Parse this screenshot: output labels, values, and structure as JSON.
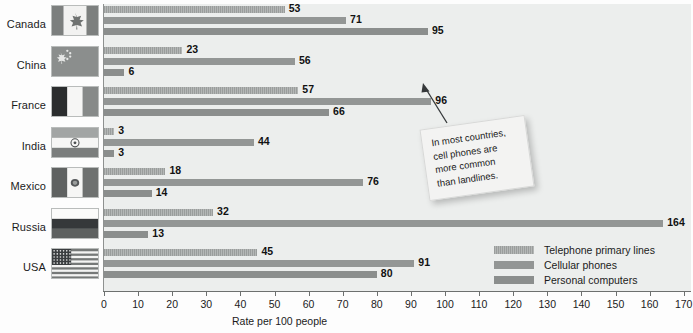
{
  "chart_data": {
    "type": "bar",
    "orientation": "horizontal",
    "title": "",
    "xlabel": "Rate per 100 people",
    "ylabel": "",
    "xlim": [
      0,
      175
    ],
    "xticks": [
      0,
      10,
      20,
      30,
      40,
      50,
      60,
      70,
      80,
      90,
      100,
      110,
      120,
      130,
      140,
      150,
      160,
      170
    ],
    "grid": false,
    "legend_position": "inside-bottom-right",
    "categories": [
      "Canada",
      "China",
      "France",
      "India",
      "Mexico",
      "Russia",
      "USA"
    ],
    "series": [
      {
        "name": "Telephone primary lines",
        "color": "#a7aaa9",
        "values": [
          53,
          23,
          57,
          3,
          18,
          32,
          45
        ]
      },
      {
        "name": "Cellular phones",
        "color": "#939695",
        "values": [
          71,
          56,
          96,
          44,
          76,
          164,
          91
        ]
      },
      {
        "name": "Personal computers",
        "color": "#8b8e8d",
        "values": [
          95,
          6,
          66,
          3,
          14,
          13,
          80
        ]
      }
    ],
    "annotations": [
      {
        "text": "In most countries,\ncell phones are\nmore common\nthan landlines.",
        "points_to": {
          "category": "France",
          "series": "Cellular phones",
          "value": 96
        }
      }
    ]
  },
  "legend": {
    "items": [
      {
        "label": "Telephone primary lines"
      },
      {
        "label": "Cellular phones"
      },
      {
        "label": "Personal computers"
      }
    ]
  },
  "axis": {
    "x_title": "Rate per 100 people",
    "tick_labels": [
      "0",
      "10",
      "20",
      "30",
      "40",
      "50",
      "60",
      "70",
      "80",
      "90",
      "100",
      "110",
      "120",
      "130",
      "140",
      "150",
      "160",
      "170"
    ]
  },
  "rows": [
    {
      "country": "Canada",
      "flag": "flag-canada",
      "values": [
        53,
        71,
        95
      ]
    },
    {
      "country": "China",
      "flag": "flag-china",
      "values": [
        23,
        56,
        6
      ]
    },
    {
      "country": "France",
      "flag": "flag-france",
      "values": [
        57,
        96,
        66
      ]
    },
    {
      "country": "India",
      "flag": "flag-india",
      "values": [
        3,
        44,
        3
      ]
    },
    {
      "country": "Mexico",
      "flag": "flag-mexico",
      "values": [
        18,
        76,
        14
      ]
    },
    {
      "country": "Russia",
      "flag": "flag-russia",
      "values": [
        32,
        164,
        13
      ]
    },
    {
      "country": "USA",
      "flag": "flag-usa",
      "values": [
        45,
        91,
        80
      ]
    }
  ],
  "callout": {
    "text": "In most countries,\ncell phones are\nmore common\nthan landlines."
  }
}
